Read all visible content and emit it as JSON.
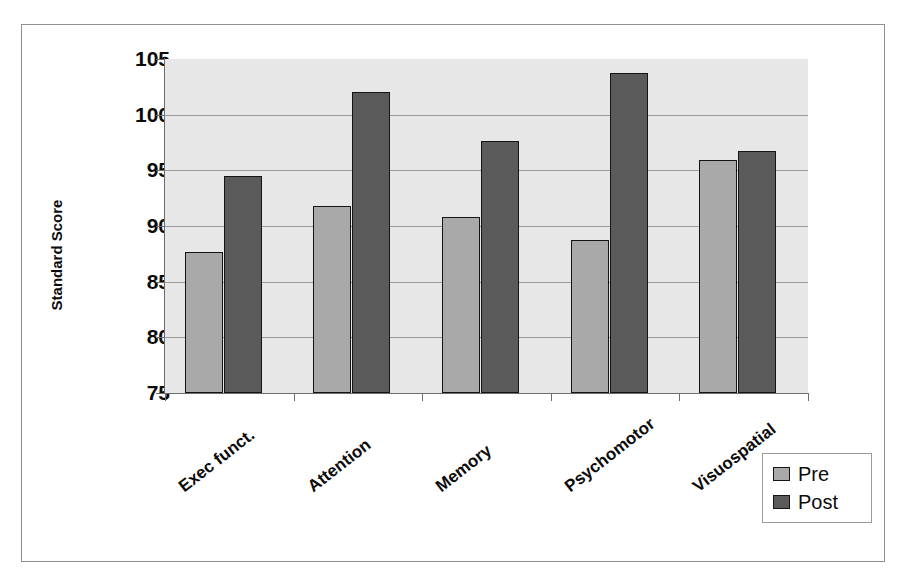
{
  "chart_data": {
    "type": "bar",
    "title": "",
    "subtitle": "",
    "xlabel": "",
    "ylabel": "Standard Score",
    "categories": [
      "Exec funct.",
      "Attention",
      "Memory",
      "Psychomotor",
      "Visuospatial"
    ],
    "series": [
      {
        "name": "Pre",
        "color": "#a9a9a9",
        "values": [
          87.7,
          91.8,
          90.8,
          88.7,
          95.9
        ]
      },
      {
        "name": "Post",
        "color": "#5a5a5a",
        "values": [
          94.5,
          102.0,
          97.6,
          103.7,
          96.7
        ]
      }
    ],
    "ylim": [
      75,
      105
    ],
    "ytick_labels": [
      "105",
      "100",
      "95",
      "90",
      "85",
      "80",
      "75"
    ],
    "ytick_values": [
      105,
      100,
      95,
      90,
      85,
      80,
      75
    ],
    "grid": true,
    "grid_axis": "y",
    "legend_position": "bottom-right",
    "legend_entries": [
      "Pre",
      "Post"
    ],
    "plot_background": "#e7e7e7",
    "figure_background": "#ffffff"
  },
  "legend": {
    "items": [
      {
        "label": "Pre"
      },
      {
        "label": "Post"
      }
    ]
  },
  "axis": {
    "y_title": "Standard Score"
  }
}
